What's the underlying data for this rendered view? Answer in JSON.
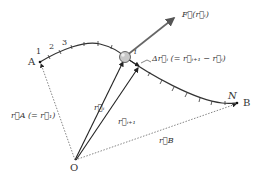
{
  "diagram": {
    "points": {
      "A": "A",
      "B": "B",
      "O": "O",
      "N": "N",
      "i": "i"
    },
    "segment_numbers": [
      "1",
      "2",
      "3"
    ],
    "labels": {
      "force": "F⃗(r⃗ᵢ)",
      "delta_r": "Δr⃗ᵢ (= r⃗ᵢ₊₁ − r⃗ᵢ)",
      "r_i": "r⃗ᵢ",
      "r_i1": "r⃗ᵢ₊₁",
      "r_A": "r⃗A (= r⃗₁)",
      "r_B": "r⃗B"
    },
    "colors": {
      "curve": "#333333",
      "force_arrow": "#666666",
      "dotted": "#777777",
      "particle": "#bbbbbb"
    }
  }
}
